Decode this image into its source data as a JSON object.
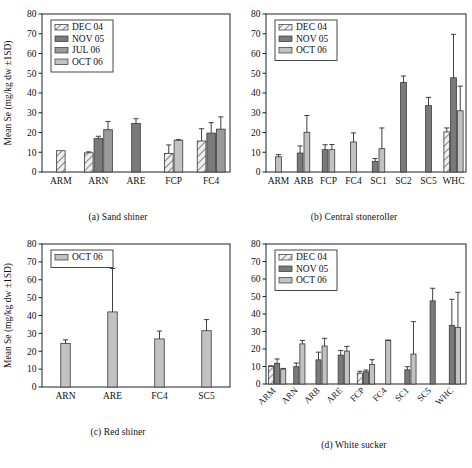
{
  "figure": {
    "axis_label": "Mean Se (mg/kg dw ±1SD)",
    "y_ticks": [
      "0",
      "10",
      "20",
      "30",
      "40",
      "50",
      "60",
      "70",
      "80"
    ],
    "series_colors": {
      "DEC 04": "#b9b9b9",
      "NOV 05": "#7a7a7a",
      "JUL 06": "#9a9a9a",
      "OCT 06": "#c2c2c2"
    },
    "captions": {
      "a": "(a) Sand shiner",
      "b": "(b) Central stoneroller",
      "c": "(c) Red shiner",
      "d": "(d) White sucker"
    }
  },
  "chart_data": [
    {
      "type": "bar",
      "panel": "a",
      "title": "(a) Sand shiner",
      "xlabel": "",
      "ylabel": "Mean Se (mg/kg dw ±1SD)",
      "ylim": [
        0,
        80
      ],
      "ytick_step": 10,
      "grid": false,
      "legend_position": "top-left",
      "categories": [
        "ARM",
        "ARN",
        "ARE",
        "FCP",
        "FC4"
      ],
      "series": [
        {
          "name": "DEC 04",
          "pattern": "diagonal-hatch",
          "values": [
            10.8,
            9.7,
            null,
            9.4,
            15.7
          ],
          "errors": [
            0,
            0.5,
            null,
            4.3,
            6.2
          ]
        },
        {
          "name": "NOV 05",
          "pattern": "solid-dark",
          "values": [
            null,
            16.9,
            24.6,
            null,
            19.7
          ],
          "errors": [
            null,
            1.2,
            2.4,
            null,
            5.3
          ]
        },
        {
          "name": "JUL 06",
          "pattern": "solid-medium",
          "values": [
            null,
            21.4,
            null,
            null,
            21.7
          ],
          "errors": [
            null,
            4.2,
            null,
            null,
            6.2
          ]
        },
        {
          "name": "OCT 06",
          "pattern": "solid-light",
          "values": [
            null,
            null,
            null,
            16.1,
            null
          ],
          "errors": [
            null,
            null,
            null,
            0.3,
            null
          ]
        }
      ]
    },
    {
      "type": "bar",
      "panel": "b",
      "title": "(b) Central stoneroller",
      "xlabel": "",
      "ylabel": "Mean Se (mg/kg dw ±1SD)",
      "ylim": [
        0,
        80
      ],
      "ytick_step": 10,
      "grid": false,
      "legend_position": "top-left",
      "categories": [
        "ARM",
        "ARB",
        "FCP",
        "FC4",
        "SC1",
        "SC2",
        "SC5",
        "WHC"
      ],
      "series": [
        {
          "name": "DEC 04",
          "pattern": "diagonal-hatch",
          "values": [
            null,
            null,
            null,
            null,
            null,
            null,
            null,
            20.3
          ],
          "errors": [
            null,
            null,
            null,
            null,
            null,
            null,
            null,
            2.0
          ]
        },
        {
          "name": "NOV 05",
          "pattern": "solid-dark",
          "values": [
            null,
            9.6,
            11.3,
            null,
            5.4,
            45.3,
            33.6,
            47.7
          ],
          "errors": [
            null,
            3.6,
            2.5,
            null,
            1.4,
            3.3,
            4.2,
            22.0
          ]
        },
        {
          "name": "OCT 06",
          "pattern": "solid-light",
          "values": [
            7.7,
            20.1,
            11.3,
            15.2,
            11.8,
            null,
            null,
            31.0
          ],
          "errors": [
            1.1,
            8.5,
            2.6,
            4.6,
            10.5,
            null,
            null,
            12.5
          ]
        }
      ]
    },
    {
      "type": "bar",
      "panel": "c",
      "title": "(c) Red shiner",
      "xlabel": "",
      "ylabel": "Mean Se (mg/kg dw ±1SD)",
      "ylim": [
        0,
        80
      ],
      "ytick_step": 10,
      "grid": false,
      "legend_position": "top-left",
      "categories": [
        "ARN",
        "ARE",
        "FC4",
        "SC5"
      ],
      "series": [
        {
          "name": "OCT 06",
          "pattern": "solid-light",
          "values": [
            24.4,
            42.0,
            26.9,
            31.5
          ],
          "errors": [
            2.0,
            24.3,
            4.4,
            6.2
          ]
        }
      ]
    },
    {
      "type": "bar",
      "panel": "d",
      "title": "(d) White sucker",
      "xlabel": "",
      "ylabel": "Mean Se (mg/kg dw ±1SD)",
      "ylim": [
        0,
        80
      ],
      "ytick_step": 10,
      "grid": false,
      "legend_position": "top-left",
      "xtick_rotation": 45,
      "categories": [
        "ARM",
        "ARN",
        "ARB",
        "ARE",
        "FCP",
        "FC4",
        "SC1",
        "SC5",
        "WHC"
      ],
      "series": [
        {
          "name": "DEC 04",
          "pattern": "diagonal-hatch",
          "values": [
            10.1,
            null,
            null,
            null,
            6.2,
            null,
            null,
            null,
            null
          ],
          "errors": [
            0.3,
            null,
            null,
            null,
            1.1,
            null,
            null,
            null,
            null
          ]
        },
        {
          "name": "NOV 05",
          "pattern": "solid-dark",
          "values": [
            11.8,
            9.9,
            13.8,
            16.5,
            7.0,
            null,
            8.1,
            47.5,
            33.4
          ],
          "errors": [
            2.5,
            2.1,
            4.4,
            2.7,
            1.0,
            null,
            1.8,
            7.2,
            15.0
          ]
        },
        {
          "name": "OCT 06",
          "pattern": "solid-light",
          "values": [
            8.5,
            22.9,
            21.7,
            18.8,
            11.1,
            24.9,
            17.1,
            null,
            32.4
          ],
          "errors": [
            0.4,
            2.0,
            4.4,
            2.7,
            2.8,
            0.2,
            18.5,
            null,
            20.0
          ]
        }
      ]
    }
  ],
  "legends": {
    "a": [
      "DEC 04",
      "NOV 05",
      "JUL 06",
      "OCT 06"
    ],
    "b": [
      "DEC 04",
      "NOV 05",
      "OCT 06"
    ],
    "c": [
      "OCT 06"
    ],
    "d": [
      "DEC 04",
      "NOV 05",
      "OCT 06"
    ]
  }
}
